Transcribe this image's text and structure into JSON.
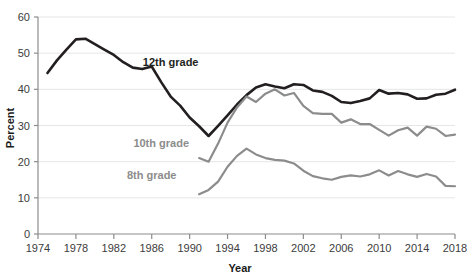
{
  "chart_data": {
    "type": "line",
    "title": "",
    "xlabel": "Year",
    "ylabel": "Percent",
    "xlim": [
      1974,
      2018
    ],
    "ylim": [
      0,
      60
    ],
    "grid": "horizontal",
    "legend_position": "inline-annotations",
    "xticks": [
      1974,
      1978,
      1982,
      1986,
      1990,
      1994,
      1998,
      2002,
      2006,
      2010,
      2014,
      2018
    ],
    "xtick_labels": [
      "1974",
      "1978",
      "1982",
      "1986",
      "1990",
      "1994",
      "1998",
      "2002",
      "2006",
      "2010",
      "2014",
      "2018"
    ],
    "yticks": [
      0,
      10,
      20,
      30,
      40,
      50,
      60
    ],
    "ytick_labels": [
      "0",
      "10",
      "20",
      "30",
      "40",
      "50",
      "60"
    ],
    "series": [
      {
        "name": "12th grade",
        "color": "#231f20",
        "label_x": 1988,
        "label_y": 46.5,
        "x": [
          1975,
          1976,
          1977,
          1978,
          1979,
          1980,
          1981,
          1982,
          1983,
          1984,
          1985,
          1986,
          1987,
          1988,
          1989,
          1990,
          1991,
          1992,
          1993,
          1994,
          1995,
          1996,
          1997,
          1998,
          1999,
          2000,
          2001,
          2002,
          2003,
          2004,
          2005,
          2006,
          2007,
          2008,
          2009,
          2010,
          2011,
          2012,
          2013,
          2014,
          2015,
          2016,
          2017,
          2018
        ],
        "values": [
          44.5,
          48.0,
          51.0,
          53.8,
          54.0,
          52.5,
          51.0,
          49.5,
          47.5,
          46.0,
          45.6,
          46.3,
          42.0,
          38.0,
          35.5,
          32.2,
          29.8,
          27.1,
          29.9,
          32.8,
          35.8,
          38.4,
          40.5,
          41.4,
          40.8,
          40.3,
          41.4,
          41.2,
          39.7,
          39.3,
          38.2,
          36.5,
          36.2,
          36.8,
          37.5,
          39.8,
          38.8,
          39.0,
          38.6,
          37.4,
          37.5,
          38.5,
          38.8,
          39.9
        ]
      },
      {
        "name": "10th grade",
        "color": "#8c8c8c",
        "label_x": 1987,
        "label_y": 24.0,
        "x": [
          1991,
          1992,
          1993,
          1994,
          1995,
          1996,
          1997,
          1998,
          1999,
          2000,
          2001,
          2002,
          2003,
          2004,
          2005,
          2006,
          2007,
          2008,
          2009,
          2010,
          2011,
          2012,
          2013,
          2014,
          2015,
          2016,
          2017,
          2018
        ],
        "values": [
          21.0,
          20.0,
          25.0,
          30.8,
          35.0,
          38.0,
          36.5,
          38.8,
          40.0,
          38.3,
          39.0,
          35.4,
          33.4,
          33.2,
          33.2,
          30.8,
          31.7,
          30.4,
          30.4,
          28.8,
          27.2,
          28.7,
          29.4,
          27.2,
          29.7,
          29.1,
          27.1,
          27.5
        ]
      },
      {
        "name": "8th grade",
        "color": "#8c8c8c",
        "label_x": 1986,
        "label_y": 15.2,
        "x": [
          1991,
          1992,
          1993,
          1994,
          1995,
          1996,
          1997,
          1998,
          1999,
          2000,
          2001,
          2002,
          2003,
          2004,
          2005,
          2006,
          2007,
          2008,
          2009,
          2010,
          2011,
          2012,
          2013,
          2014,
          2015,
          2016,
          2017,
          2018
        ],
        "values": [
          11.0,
          12.2,
          14.5,
          18.6,
          21.6,
          23.6,
          22.0,
          21.0,
          20.5,
          20.3,
          19.5,
          17.5,
          16.0,
          15.4,
          15.0,
          15.8,
          16.2,
          15.9,
          16.5,
          17.6,
          16.2,
          17.4,
          16.5,
          15.8,
          16.6,
          15.9,
          13.3,
          13.2
        ]
      }
    ]
  }
}
